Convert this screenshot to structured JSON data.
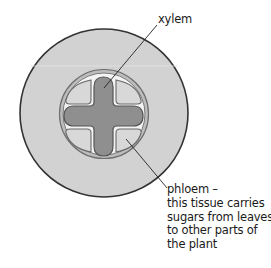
{
  "diagram": {
    "colors": {
      "cortex_fill": "#d2d2d2",
      "cortex_outline": "#333333",
      "ring_fill": "#f2f2f2",
      "ring_outline": "#7a7a7a",
      "xylem_fill": "#8f8f8f",
      "xylem_outline": "#555555",
      "phloem_fill": "#d8d8d8",
      "phloem_outline": "#6a6a6a",
      "leader_line": "#222222",
      "label_text": "#1a1a1a"
    },
    "labels": {
      "xylem": {
        "text": "xylem"
      },
      "phloem": {
        "lines": [
          "phloem –",
          "this tissue carries",
          "sugars from leaves",
          "to other parts of",
          "the plant"
        ]
      }
    }
  }
}
